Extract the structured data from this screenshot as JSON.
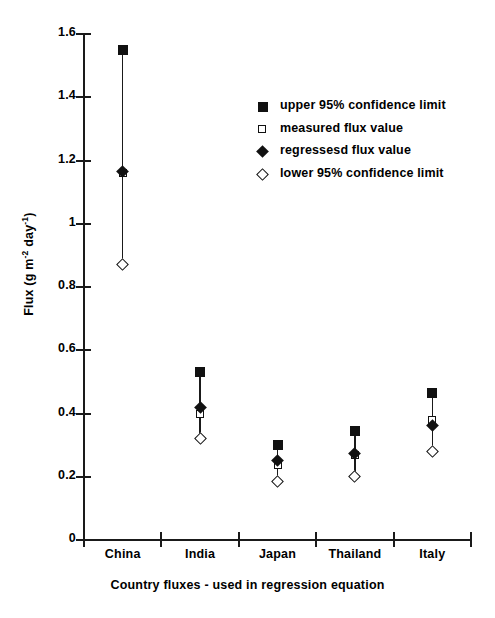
{
  "chart_data": {
    "type": "scatter",
    "title": "",
    "xlabel": "Country fluxes - used in regression equation",
    "ylabel": "Flux (g m-2 day-1)",
    "ylabel_parts": {
      "prefix": "Flux (g m",
      "sup1": "-2",
      "middle": " day",
      "sup2": "-1",
      "suffix": ")"
    },
    "categories": [
      "China",
      "India",
      "Japan",
      "Thailand",
      "Italy"
    ],
    "ylim": [
      0,
      1.6
    ],
    "ytick_labels": [
      "0",
      "0.2",
      "0.4",
      "0.6",
      "0.8",
      "1",
      "1.2",
      "1.4",
      "1.6"
    ],
    "ytick_values": [
      0,
      0.2,
      0.4,
      0.6,
      0.8,
      1.0,
      1.2,
      1.4,
      1.6
    ],
    "grid": false,
    "legend_position": "upper right",
    "series": [
      {
        "name": "upper 95% confidence limit",
        "marker": "filled-square",
        "values": [
          1.55,
          0.53,
          0.3,
          0.345,
          0.465
        ]
      },
      {
        "name": "measured flux value",
        "marker": "open-square",
        "values": [
          1.16,
          0.4,
          0.238,
          0.268,
          0.378
        ]
      },
      {
        "name": "regressesd flux value",
        "marker": "filled-diamond",
        "values": [
          1.165,
          0.42,
          0.252,
          0.272,
          0.362
        ]
      },
      {
        "name": "lower 95% confidence limit",
        "marker": "open-diamond",
        "values": [
          0.87,
          0.32,
          0.185,
          0.2,
          0.28
        ]
      }
    ]
  },
  "legend": {
    "items": [
      {
        "label": "upper 95% confidence limit",
        "marker": "filled-square"
      },
      {
        "label": "measured flux value",
        "marker": "open-square"
      },
      {
        "label": "regressesd flux value",
        "marker": "filled-diamond"
      },
      {
        "label": "lower 95% confidence limit",
        "marker": "open-diamond"
      }
    ]
  },
  "colors": {
    "ink": "#1a1a1a",
    "marker": "#111111",
    "background": "#ffffff"
  }
}
